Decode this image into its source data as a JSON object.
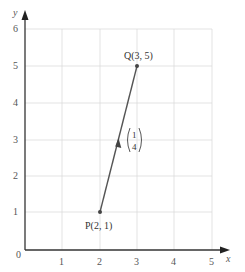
{
  "diagram": {
    "type": "coordinate-vector",
    "axes": {
      "x_label": "x",
      "y_label": "y",
      "origin_label": "0",
      "x_ticks": [
        "1",
        "2",
        "3",
        "4",
        "5"
      ],
      "y_ticks": [
        "1",
        "2",
        "3",
        "4",
        "5",
        "6"
      ],
      "xlim": [
        0,
        5
      ],
      "ylim": [
        0,
        6
      ],
      "grid": true
    },
    "points": [
      {
        "name": "P",
        "x": 2,
        "y": 1,
        "label": "P(2, 1)"
      },
      {
        "name": "Q",
        "x": 3,
        "y": 5,
        "label": "Q(3, 5)"
      }
    ],
    "vector": {
      "from": "P",
      "to": "Q",
      "column_top": "1",
      "column_bottom": "4"
    },
    "colors": {
      "grid": "#d9d9d9",
      "axis": "#333333",
      "vector": "#555555",
      "point": "#444444"
    }
  }
}
